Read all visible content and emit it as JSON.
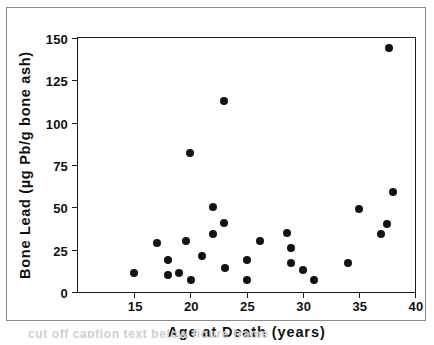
{
  "chart_data": {
    "type": "scatter",
    "title": "",
    "xlabel": "Age at Death  (years)",
    "ylabel": "Bone Lead  (µg Pb/g bone ash)",
    "xlim": [
      10,
      40
    ],
    "ylim": [
      0,
      150
    ],
    "xticks": [
      15,
      20,
      25,
      30,
      35,
      40
    ],
    "yticks": [
      0,
      25,
      50,
      75,
      100,
      125,
      150
    ],
    "xtick_labels": [
      "15",
      "20",
      "25",
      "30",
      "35",
      "40"
    ],
    "ytick_labels": [
      "0",
      "25",
      "50",
      "75",
      "100",
      "125",
      "150"
    ],
    "grid": false,
    "legend": null,
    "marker": "filled-circle",
    "marker_color": "#141414",
    "points": [
      {
        "x": 15.0,
        "y": 11
      },
      {
        "x": 17.0,
        "y": 29
      },
      {
        "x": 18.0,
        "y": 19
      },
      {
        "x": 18.0,
        "y": 10
      },
      {
        "x": 19.0,
        "y": 11
      },
      {
        "x": 19.6,
        "y": 30
      },
      {
        "x": 20.0,
        "y": 82
      },
      {
        "x": 20.1,
        "y": 7
      },
      {
        "x": 21.0,
        "y": 21
      },
      {
        "x": 22.0,
        "y": 50
      },
      {
        "x": 22.0,
        "y": 34
      },
      {
        "x": 23.0,
        "y": 113
      },
      {
        "x": 23.0,
        "y": 41
      },
      {
        "x": 23.1,
        "y": 14
      },
      {
        "x": 25.0,
        "y": 19
      },
      {
        "x": 25.0,
        "y": 7
      },
      {
        "x": 26.2,
        "y": 30
      },
      {
        "x": 28.6,
        "y": 35
      },
      {
        "x": 29.0,
        "y": 26
      },
      {
        "x": 29.0,
        "y": 17
      },
      {
        "x": 30.0,
        "y": 13
      },
      {
        "x": 31.0,
        "y": 7
      },
      {
        "x": 34.0,
        "y": 17
      },
      {
        "x": 35.0,
        "y": 49
      },
      {
        "x": 37.0,
        "y": 34
      },
      {
        "x": 37.5,
        "y": 40
      },
      {
        "x": 37.7,
        "y": 144
      },
      {
        "x": 38.0,
        "y": 59
      }
    ]
  },
  "caption_artifact": "cut off caption text below figure frame"
}
